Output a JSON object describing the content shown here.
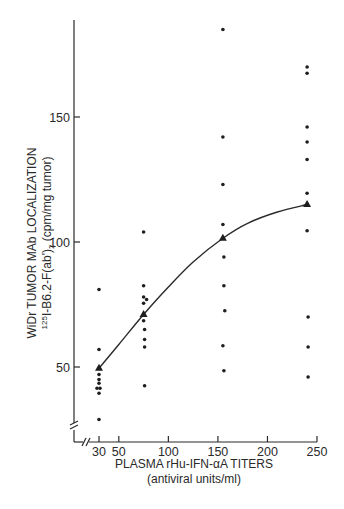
{
  "chart_data": {
    "type": "scatter",
    "title": "",
    "xlabel": "PLASMA rHu-IFN-αA TITERS",
    "xlabel_sub": "(antiviral units/ml)",
    "ylabel": "WiDr TUMOR MAb LOCALIZATION",
    "ylabel_sub_prefix": "125",
    "ylabel_sub_main": "I-B6.2-F(ab')",
    "ylabel_sub_subscript": "2",
    "ylabel_sub_suffix": " (cpm/mg tumor)",
    "xlim": [
      20,
      255
    ],
    "ylim": [
      25,
      190
    ],
    "x_ticks": [
      30,
      50,
      100,
      150,
      200,
      250
    ],
    "y_ticks": [
      50,
      100,
      150
    ],
    "grid": false,
    "axis_breaks": {
      "x": true,
      "y": true
    },
    "series": [
      {
        "name": "Individual tumors",
        "marker": "dot",
        "points": [
          [
            30,
            81
          ],
          [
            30,
            57
          ],
          [
            30,
            47
          ],
          [
            30,
            45
          ],
          [
            30,
            43.5
          ],
          [
            28,
            41.5
          ],
          [
            31,
            41.5
          ],
          [
            30,
            39.5
          ],
          [
            30,
            29
          ],
          [
            75,
            104
          ],
          [
            75,
            82.5
          ],
          [
            75,
            78
          ],
          [
            78,
            77
          ],
          [
            75,
            75.5
          ],
          [
            75,
            68.5
          ],
          [
            76,
            65
          ],
          [
            76,
            61
          ],
          [
            76,
            58
          ],
          [
            76,
            42.5
          ],
          [
            155,
            185
          ],
          [
            155,
            142
          ],
          [
            155,
            123
          ],
          [
            155,
            107
          ],
          [
            156,
            94
          ],
          [
            156,
            82.5
          ],
          [
            157,
            72.5
          ],
          [
            155,
            58.5
          ],
          [
            156,
            48.5
          ],
          [
            240,
            170
          ],
          [
            240,
            167.5
          ],
          [
            240,
            146
          ],
          [
            240,
            140
          ],
          [
            240,
            133
          ],
          [
            240,
            119.5
          ],
          [
            240,
            104.5
          ],
          [
            241,
            70
          ],
          [
            241,
            58
          ],
          [
            241,
            46
          ]
        ]
      },
      {
        "name": "Group mean",
        "marker": "triangle",
        "points": [
          [
            30,
            49.5
          ],
          [
            75,
            71
          ],
          [
            155,
            101.5
          ],
          [
            240,
            115
          ]
        ]
      },
      {
        "name": "Fitted curve",
        "marker": "line",
        "points": [
          [
            30,
            49.5
          ],
          [
            50,
            59
          ],
          [
            75,
            71
          ],
          [
            100,
            82
          ],
          [
            125,
            92
          ],
          [
            155,
            101.5
          ],
          [
            180,
            107.5
          ],
          [
            210,
            112
          ],
          [
            240,
            115
          ]
        ]
      }
    ]
  }
}
